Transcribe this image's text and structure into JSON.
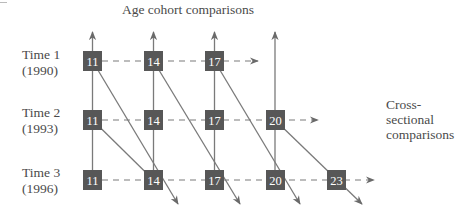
{
  "diagram": {
    "title": "Age cohort comparisons",
    "side_label": [
      "Cross-",
      "sectional",
      "comparisons"
    ],
    "rows": [
      {
        "time": "Time 1",
        "year": "(1990)",
        "ages": [
          11,
          14,
          17
        ]
      },
      {
        "time": "Time 2",
        "year": "(1993)",
        "ages": [
          11,
          14,
          17,
          20
        ]
      },
      {
        "time": "Time 3",
        "year": "(1996)",
        "ages": [
          11,
          14,
          17,
          20,
          23
        ]
      }
    ],
    "colors": {
      "box": "#575757",
      "line": "#7a7a7a",
      "text": "#4a4a4a"
    }
  }
}
